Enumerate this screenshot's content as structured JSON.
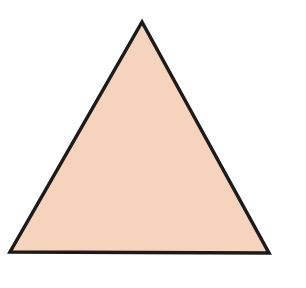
{
  "diagram": {
    "shape": "equilateral-triangle",
    "fill_color": "#f5d3bd",
    "stroke_color": "#1c1a1a",
    "stroke_width": 3.5,
    "vertices": {
      "apex": [
        142,
        22
      ],
      "bottom_left": [
        10,
        252
      ],
      "bottom_right": [
        269,
        253
      ]
    }
  }
}
